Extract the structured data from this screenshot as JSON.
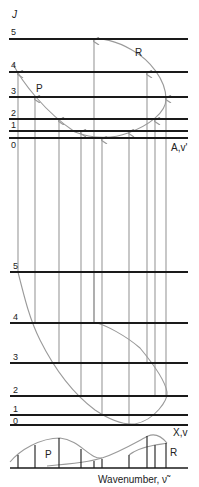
{
  "axis_label": "J",
  "upper_state": {
    "label": "A,v'",
    "levels": [
      {
        "J": "5",
        "y": 39
      },
      {
        "J": "4",
        "y": 72
      },
      {
        "J": "3",
        "y": 97
      },
      {
        "J": "2",
        "y": 119
      },
      {
        "J": "1",
        "y": 131
      },
      {
        "J": "0",
        "y": 138
      }
    ]
  },
  "lower_state": {
    "label": "X,v",
    "levels": [
      {
        "J": "5",
        "y": 272
      },
      {
        "J": "4",
        "y": 323
      },
      {
        "J": "3",
        "y": 363
      },
      {
        "J": "2",
        "y": 396
      },
      {
        "J": "1",
        "y": 415
      },
      {
        "J": "0",
        "y": 425
      }
    ]
  },
  "branches": {
    "p_label": "P",
    "r_label": "R"
  },
  "spectrum": {
    "p_label": "P",
    "r_label": "R",
    "x_axis_label": "Wavenumber, ν̃"
  },
  "colors": {
    "level_line": "#1a1a1a",
    "transition": "#9a9a9a",
    "text": "#222222"
  }
}
